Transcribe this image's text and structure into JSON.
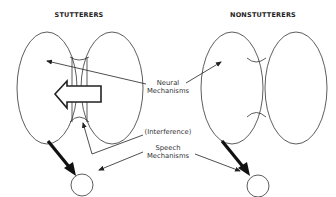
{
  "diagram": {
    "panels": [
      {
        "title": "STUTTERERS"
      },
      {
        "title": "NONSTUTTERERS"
      }
    ],
    "labels": {
      "neural_line1": "Neural",
      "neural_line2": "Mechanisms",
      "interference": "(Interference)",
      "speech_line1": "Speech",
      "speech_line2": "Mechanisms"
    },
    "colors": {
      "stroke": "#333333",
      "background": "#ffffff"
    }
  }
}
